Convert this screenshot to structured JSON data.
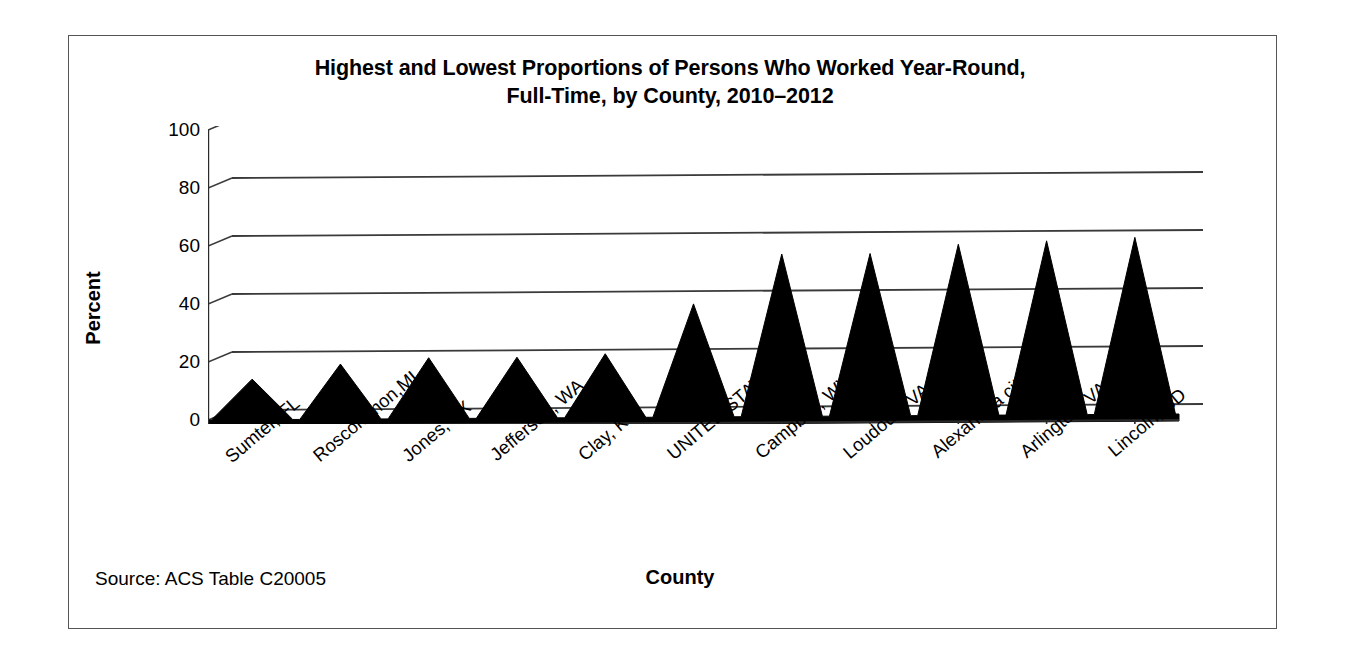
{
  "figure": {
    "title_line1": "Highest and Lowest Proportions of Persons Who Worked Year-Round,",
    "title_line2": "Full-Time, by County, 2010–2012",
    "source_note": "Source: ACS Table C20005",
    "border_color": "#555555",
    "series_color": "#000000",
    "background": "#ffffff"
  },
  "chart_data": {
    "type": "area",
    "title": "Highest and Lowest Proportions of Persons Who Worked Year-Round, Full-Time, by County, 2010–2012",
    "xlabel": "County",
    "ylabel": "Percent",
    "categories": [
      "Sumter, FL",
      "Roscommon,MI",
      "Jones, TX",
      "Jefferson, WA",
      "Clay, KY",
      "UNITED STATES",
      "Campbell, WY",
      "Loudoun, VA",
      "Alexandria city, VA",
      "Arlington, VA",
      "Lincoln, SD"
    ],
    "values": [
      14,
      19,
      21,
      21,
      22,
      39,
      56,
      56,
      59,
      60,
      61
    ],
    "series": [
      {
        "name": "Percent worked year-round, full-time",
        "values": [
          14,
          19,
          21,
          21,
          22,
          39,
          56,
          56,
          59,
          60,
          61
        ]
      }
    ],
    "ylim": [
      0,
      100
    ],
    "yticks": [
      0,
      20,
      40,
      60,
      80,
      100
    ],
    "ytick_labels": [
      "0",
      "20",
      "40",
      "60",
      "80",
      "100"
    ],
    "grid": true,
    "legend": false,
    "legend_position": "none",
    "style_3d": true,
    "annotations": [
      "Source: ACS Table C20005"
    ]
  }
}
